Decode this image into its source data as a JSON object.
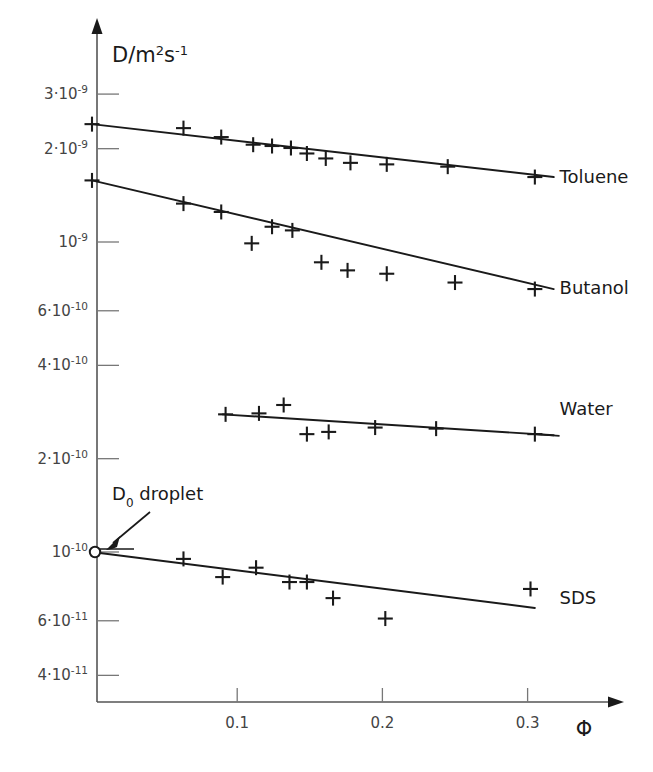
{
  "chart_data": {
    "type": "scatter",
    "title": "",
    "subtitle": "",
    "xlabel": "Φ",
    "ylabel": "D/m²s⁻¹",
    "grid": false,
    "legend_position": "right-inline",
    "x_scale": "linear",
    "y_scale": "log",
    "xlim": [
      0,
      0.345
    ],
    "ylim": [
      3.4e-11,
      3.9e-09
    ],
    "xticks": [
      0.1,
      0.2,
      0.3
    ],
    "xtick_labels": [
      "0.1",
      "0.2",
      "0.3"
    ],
    "yticks": [
      3e-09,
      2e-09,
      1e-09,
      6e-10,
      4e-10,
      2e-10,
      1e-10,
      6e-11,
      4e-11
    ],
    "ytick_labels": [
      {
        "mantissa": "3·10",
        "exponent": "-9"
      },
      {
        "mantissa": "2·10",
        "exponent": "-9"
      },
      {
        "mantissa": "10",
        "exponent": "-9"
      },
      {
        "mantissa": "6·10",
        "exponent": "-10"
      },
      {
        "mantissa": "4·10",
        "exponent": "-10"
      },
      {
        "mantissa": "2·10",
        "exponent": "-10"
      },
      {
        "mantissa": "10",
        "exponent": "-10"
      },
      {
        "mantissa": "6·10",
        "exponent": "-11"
      },
      {
        "mantissa": "4·10",
        "exponent": "-11"
      }
    ],
    "annotations": [
      {
        "name": "d0-droplet",
        "text_main": "D",
        "text_sub": "0",
        "text_rest": " droplet",
        "points_to_x": 0.0,
        "points_to_y": 1e-10,
        "marker": "open-circle"
      }
    ],
    "series": [
      {
        "name": "Toluene",
        "marker": "plus",
        "color": "#1a1a1a",
        "label_x": 0.322,
        "label_y": 1.62e-09,
        "fit_line": {
          "x0": 0.0,
          "y0": 2.4e-09,
          "x1": 0.318,
          "y1": 1.62e-09
        },
        "points": [
          {
            "x": 0.0,
            "y": 2.4e-09
          },
          {
            "x": 0.063,
            "y": 2.33e-09
          },
          {
            "x": 0.089,
            "y": 2.18e-09
          },
          {
            "x": 0.111,
            "y": 2.06e-09
          },
          {
            "x": 0.124,
            "y": 2.04e-09
          },
          {
            "x": 0.137,
            "y": 2.01e-09
          },
          {
            "x": 0.148,
            "y": 1.93e-09
          },
          {
            "x": 0.161,
            "y": 1.86e-09
          },
          {
            "x": 0.178,
            "y": 1.8e-09
          },
          {
            "x": 0.203,
            "y": 1.78e-09
          },
          {
            "x": 0.245,
            "y": 1.75e-09
          },
          {
            "x": 0.305,
            "y": 1.62e-09
          }
        ]
      },
      {
        "name": "Butanol",
        "marker": "plus",
        "color": "#1a1a1a",
        "label_x": 0.322,
        "label_y": 7.1e-10,
        "fit_line": {
          "x0": 0.0,
          "y0": 1.58e-09,
          "x1": 0.318,
          "y1": 7.05e-10
        },
        "points": [
          {
            "x": 0.0,
            "y": 1.58e-09
          },
          {
            "x": 0.063,
            "y": 1.33e-09
          },
          {
            "x": 0.089,
            "y": 1.25e-09
          },
          {
            "x": 0.11,
            "y": 9.9e-10
          },
          {
            "x": 0.124,
            "y": 1.12e-09
          },
          {
            "x": 0.138,
            "y": 1.09e-09
          },
          {
            "x": 0.158,
            "y": 8.6e-10
          },
          {
            "x": 0.176,
            "y": 8.1e-10
          },
          {
            "x": 0.203,
            "y": 7.9e-10
          },
          {
            "x": 0.25,
            "y": 7.4e-10
          },
          {
            "x": 0.305,
            "y": 7.05e-10
          }
        ]
      },
      {
        "name": "Water",
        "marker": "plus",
        "color": "#1a1a1a",
        "label_x": 0.322,
        "label_y": 2.9e-10,
        "fit_line": {
          "x0": 0.09,
          "y0": 2.78e-10,
          "x1": 0.318,
          "y1": 2.38e-10
        },
        "points": [
          {
            "x": 0.092,
            "y": 2.78e-10
          },
          {
            "x": 0.115,
            "y": 2.8e-10
          },
          {
            "x": 0.132,
            "y": 2.98e-10
          },
          {
            "x": 0.148,
            "y": 2.4e-10
          },
          {
            "x": 0.163,
            "y": 2.44e-10
          },
          {
            "x": 0.195,
            "y": 2.52e-10
          },
          {
            "x": 0.237,
            "y": 2.5e-10
          },
          {
            "x": 0.305,
            "y": 2.4e-10
          }
        ]
      },
      {
        "name": "SDS",
        "marker": "plus",
        "color": "#1a1a1a",
        "label_x": 0.322,
        "label_y": 7.1e-11,
        "fit_line": {
          "x0": 0.0,
          "y0": 1e-10,
          "x1": 0.305,
          "y1": 6.6e-11
        },
        "points": [
          {
            "x": 0.063,
            "y": 9.5e-11
          },
          {
            "x": 0.09,
            "y": 8.3e-11
          },
          {
            "x": 0.113,
            "y": 8.9e-11
          },
          {
            "x": 0.136,
            "y": 8e-11
          },
          {
            "x": 0.148,
            "y": 8e-11
          },
          {
            "x": 0.166,
            "y": 7.1e-11
          },
          {
            "x": 0.202,
            "y": 6.1e-11
          },
          {
            "x": 0.302,
            "y": 7.6e-11
          }
        ]
      }
    ]
  }
}
